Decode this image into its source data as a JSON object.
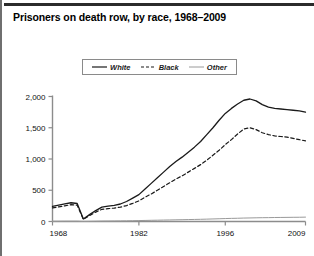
{
  "figure": {
    "title": "Prisoners on death row, by race, 1968–2009",
    "accent_color": "#2b2b2b",
    "border_color": "#6f6f6f"
  },
  "legend": {
    "position": "top-center",
    "entries": [
      {
        "label": "White",
        "style": "solid",
        "color": "#1a1a1a",
        "icon": "solid-line-swatch"
      },
      {
        "label": "Black",
        "style": "dashed",
        "color": "#1a1a1a",
        "icon": "dashed-line-swatch"
      },
      {
        "label": "Other",
        "style": "solid-thin",
        "color": "#9a9a9a",
        "icon": "thin-line-swatch"
      }
    ]
  },
  "chart_data": {
    "type": "line",
    "title": "Prisoners on death row, by race, 1968–2009",
    "xlabel": "",
    "ylabel": "",
    "xlim": [
      1968,
      2009
    ],
    "ylim": [
      0,
      2000
    ],
    "grid": false,
    "legend_position": "top-center",
    "xticks": [
      1968,
      1982,
      1996,
      2009
    ],
    "xtick_labels": [
      "1968",
      "1982",
      "1996",
      "2009"
    ],
    "yticks": [
      0,
      500,
      1000,
      1500,
      2000
    ],
    "ytick_labels": [
      "0",
      "500",
      "1,000",
      "1,500",
      "2,000"
    ],
    "x": [
      1968,
      1969,
      1970,
      1971,
      1972,
      1973,
      1974,
      1975,
      1976,
      1977,
      1978,
      1979,
      1980,
      1981,
      1982,
      1983,
      1984,
      1985,
      1986,
      1987,
      1988,
      1989,
      1990,
      1991,
      1992,
      1993,
      1994,
      1995,
      1996,
      1997,
      1998,
      1999,
      2000,
      2001,
      2002,
      2003,
      2004,
      2005,
      2006,
      2007,
      2008,
      2009
    ],
    "series": [
      {
        "name": "White",
        "style": "solid",
        "color": "#1a1a1a",
        "values": [
          243,
          261,
          281,
          300,
          288,
          40,
          110,
          175,
          230,
          245,
          258,
          280,
          320,
          375,
          430,
          520,
          610,
          700,
          790,
          880,
          960,
          1030,
          1110,
          1190,
          1280,
          1390,
          1500,
          1620,
          1730,
          1810,
          1880,
          1940,
          1960,
          1930,
          1870,
          1830,
          1810,
          1800,
          1790,
          1780,
          1770,
          1750
        ]
      },
      {
        "name": "Black",
        "style": "dashed",
        "color": "#1a1a1a",
        "values": [
          217,
          235,
          250,
          270,
          262,
          35,
          95,
          150,
          195,
          205,
          215,
          230,
          255,
          290,
          330,
          390,
          440,
          500,
          560,
          620,
          680,
          730,
          790,
          850,
          910,
          980,
          1060,
          1140,
          1230,
          1310,
          1400,
          1480,
          1500,
          1470,
          1420,
          1390,
          1370,
          1360,
          1350,
          1330,
          1310,
          1290
        ]
      },
      {
        "name": "Other",
        "style": "solid-thin",
        "color": "#9a9a9a",
        "values": [
          5,
          5,
          6,
          6,
          6,
          2,
          3,
          5,
          7,
          8,
          9,
          10,
          11,
          13,
          15,
          17,
          19,
          21,
          23,
          25,
          27,
          29,
          31,
          33,
          35,
          38,
          41,
          44,
          47,
          50,
          52,
          55,
          57,
          59,
          61,
          62,
          64,
          65,
          66,
          67,
          68,
          70
        ]
      }
    ]
  }
}
